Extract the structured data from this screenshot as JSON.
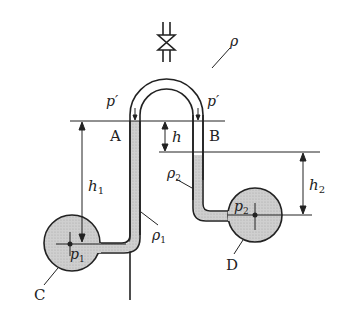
{
  "diagram": {
    "type": "differential manometer (inverted U-tube)",
    "labels": {
      "rho_top": "ρ",
      "p_prime_left": "p′",
      "p_prime_right": "p′",
      "point_A": "A",
      "point_B": "B",
      "h": "h",
      "h1_base": "h",
      "h1_sub": "1",
      "h2_base": "h",
      "h2_sub": "2",
      "rho1_base": "ρ",
      "rho1_sub": "1",
      "rho2_base": "ρ",
      "rho2_sub": "2",
      "p1_base": "p",
      "p1_sub": "1",
      "p2_base": "p",
      "p2_sub": "2",
      "vessel_C": "C",
      "vessel_D": "D"
    },
    "colors": {
      "line": "#222222",
      "fluid_fill": "#c8c8c8",
      "background": "#ffffff"
    }
  }
}
